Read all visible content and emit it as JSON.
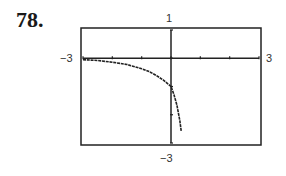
{
  "problem": {
    "number": "78."
  },
  "chart_data": {
    "type": "line",
    "title": "",
    "xlabel": "",
    "ylabel": "",
    "xlim": [
      -3,
      3
    ],
    "ylim": [
      -3,
      1
    ],
    "x_tick_labels": {
      "xmin": "−3",
      "xmax": "3"
    },
    "y_tick_labels": {
      "ymax": "1",
      "ymin": "−3"
    },
    "x_ticks": [
      -3,
      -2,
      -1,
      0,
      1,
      2,
      3
    ],
    "y_ticks": [
      1,
      0,
      -1,
      -2,
      -3
    ],
    "grid": false,
    "legend": null,
    "series": [
      {
        "name": "graph",
        "x": [
          -3,
          -2.5,
          -2,
          -1.5,
          -1,
          -0.75,
          -0.5,
          -0.25,
          0,
          0.1,
          0.2,
          0.3,
          0.35
        ],
        "values": [
          -0.05,
          -0.08,
          -0.14,
          -0.22,
          -0.37,
          -0.47,
          -0.61,
          -0.78,
          -1.0,
          -1.28,
          -1.66,
          -2.2,
          -2.6
        ]
      }
    ]
  },
  "style": {
    "frame_color": "#222222",
    "axis_color": "#222222",
    "curve_color": "#222222"
  }
}
